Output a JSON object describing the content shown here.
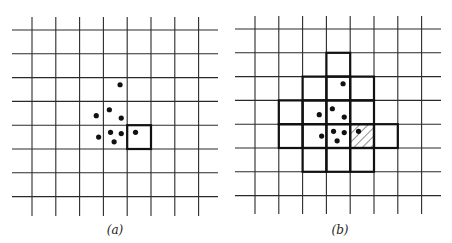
{
  "figure": {
    "panels": [
      {
        "id": "a",
        "caption": "(a)",
        "grid": {
          "vertical_lines": 8,
          "horizontal_lines": 8
        },
        "points": [
          {
            "col": 4.7,
            "row": 2.3
          },
          {
            "col": 4.25,
            "row": 3.35
          },
          {
            "col": 3.7,
            "row": 3.6
          },
          {
            "col": 4.75,
            "row": 3.7
          },
          {
            "col": 3.8,
            "row": 4.5
          },
          {
            "col": 4.3,
            "row": 4.3
          },
          {
            "col": 4.75,
            "row": 4.35
          },
          {
            "col": 4.45,
            "row": 4.7
          },
          {
            "col": 5.35,
            "row": 4.3
          }
        ],
        "bold_cells": [
          {
            "col": 5,
            "row": 4
          }
        ],
        "hatched_cells": []
      },
      {
        "id": "b",
        "caption": "(b)",
        "grid": {
          "vertical_lines": 8,
          "horizontal_lines": 8
        },
        "points": [
          {
            "col": 4.7,
            "row": 2.3
          },
          {
            "col": 4.25,
            "row": 3.35
          },
          {
            "col": 3.7,
            "row": 3.6
          },
          {
            "col": 4.75,
            "row": 3.7
          },
          {
            "col": 3.8,
            "row": 4.5
          },
          {
            "col": 4.3,
            "row": 4.3
          },
          {
            "col": 4.75,
            "row": 4.35
          },
          {
            "col": 4.45,
            "row": 4.7
          },
          {
            "col": 5.35,
            "row": 4.3
          }
        ],
        "bold_cells": [
          {
            "col": 4,
            "row": 1
          },
          {
            "col": 3,
            "row": 2
          },
          {
            "col": 4,
            "row": 2
          },
          {
            "col": 5,
            "row": 2
          },
          {
            "col": 2,
            "row": 3
          },
          {
            "col": 3,
            "row": 3
          },
          {
            "col": 4,
            "row": 3
          },
          {
            "col": 5,
            "row": 3
          },
          {
            "col": 2,
            "row": 4
          },
          {
            "col": 3,
            "row": 4
          },
          {
            "col": 4,
            "row": 4
          },
          {
            "col": 5,
            "row": 4
          },
          {
            "col": 6,
            "row": 4
          },
          {
            "col": 3,
            "row": 5
          },
          {
            "col": 4,
            "row": 5
          },
          {
            "col": 5,
            "row": 5
          }
        ],
        "hatched_cells": [
          {
            "col": 5,
            "row": 4
          }
        ]
      }
    ]
  }
}
